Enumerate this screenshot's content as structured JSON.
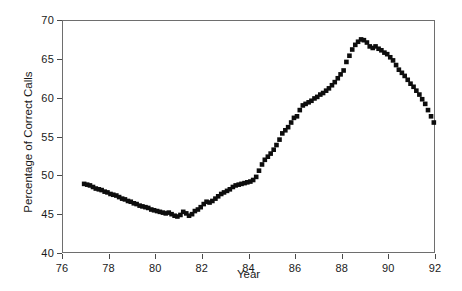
{
  "chart_data": {
    "type": "scatter",
    "title": "",
    "subtitle": "",
    "xlabel": "Year",
    "ylabel": "Percentage of Correct Calls",
    "xlim": [
      76,
      92
    ],
    "ylim": [
      40,
      70
    ],
    "xticks": [
      76,
      78,
      80,
      82,
      84,
      86,
      88,
      90,
      92
    ],
    "yticks": [
      40,
      45,
      50,
      55,
      60,
      65,
      70
    ],
    "xtick_labels": [
      "76",
      "78",
      "80",
      "82",
      "84",
      "86",
      "88",
      "90",
      "92"
    ],
    "ytick_labels": [
      "40",
      "45",
      "50",
      "55",
      "60",
      "65",
      "70"
    ],
    "grid": false,
    "legend": null,
    "legend_position": "none",
    "marker": "square",
    "marker_color": "#0d0d0d",
    "marker_size_px": 4.6,
    "frame_color": "#6e6e6e",
    "background_color": "#ffffff",
    "series": [
      {
        "name": "Percentage of Correct Calls",
        "x": [
          76.95,
          77.08,
          77.2,
          77.33,
          77.45,
          77.58,
          77.7,
          77.83,
          77.95,
          78.08,
          78.2,
          78.33,
          78.45,
          78.58,
          78.7,
          78.83,
          78.95,
          79.08,
          79.2,
          79.33,
          79.45,
          79.58,
          79.7,
          79.83,
          79.95,
          80.08,
          80.2,
          80.33,
          80.45,
          80.58,
          80.7,
          80.83,
          80.95,
          81.08,
          81.2,
          81.33,
          81.45,
          81.58,
          81.7,
          81.83,
          81.95,
          82.08,
          82.2,
          82.33,
          82.45,
          82.58,
          82.7,
          82.83,
          82.95,
          83.08,
          83.2,
          83.33,
          83.45,
          83.58,
          83.7,
          83.83,
          83.95,
          84.08,
          84.2,
          84.33,
          84.45,
          84.58,
          84.7,
          84.83,
          84.95,
          85.08,
          85.2,
          85.33,
          85.45,
          85.58,
          85.7,
          85.83,
          85.95,
          86.08,
          86.2,
          86.33,
          86.45,
          86.58,
          86.7,
          86.83,
          86.95,
          87.08,
          87.2,
          87.33,
          87.45,
          87.58,
          87.7,
          87.83,
          87.95,
          88.08,
          88.2,
          88.33,
          88.45,
          88.58,
          88.7,
          88.83,
          88.95,
          89.08,
          89.2,
          89.33,
          89.45,
          89.58,
          89.7,
          89.83,
          89.95,
          90.08,
          90.2,
          90.33,
          90.45,
          90.58,
          90.7,
          90.83,
          90.95,
          91.08,
          91.2,
          91.33,
          91.45,
          91.58,
          91.7,
          91.83,
          91.95
        ],
        "y": [
          48.9,
          48.8,
          48.7,
          48.5,
          48.3,
          48.2,
          48.1,
          47.9,
          47.8,
          47.6,
          47.5,
          47.4,
          47.2,
          47.0,
          46.9,
          46.7,
          46.6,
          46.4,
          46.3,
          46.1,
          46.0,
          45.9,
          45.8,
          45.6,
          45.5,
          45.4,
          45.3,
          45.2,
          45.1,
          45.2,
          45.0,
          44.8,
          44.7,
          44.9,
          45.3,
          45.1,
          44.8,
          45.0,
          45.4,
          45.6,
          45.9,
          46.3,
          46.6,
          46.5,
          46.7,
          47.0,
          47.3,
          47.6,
          47.8,
          48.0,
          48.2,
          48.5,
          48.7,
          48.8,
          48.9,
          49.0,
          49.1,
          49.2,
          49.4,
          49.8,
          50.6,
          51.4,
          52.0,
          52.4,
          52.8,
          53.3,
          53.9,
          54.6,
          55.4,
          55.8,
          56.2,
          56.8,
          57.4,
          57.6,
          58.4,
          59.0,
          59.2,
          59.4,
          59.6,
          59.9,
          60.1,
          60.4,
          60.6,
          60.9,
          61.2,
          61.6,
          62.0,
          62.5,
          63.0,
          63.5,
          64.6,
          65.4,
          66.2,
          66.8,
          67.2,
          67.5,
          67.4,
          67.1,
          66.6,
          66.4,
          66.6,
          66.3,
          66.1,
          65.8,
          65.6,
          65.2,
          64.8,
          64.2,
          63.6,
          63.2,
          62.8,
          62.3,
          61.8,
          61.4,
          60.9,
          60.4,
          59.8,
          59.2,
          58.4,
          57.6,
          56.8
        ]
      }
    ],
    "annotations": []
  }
}
